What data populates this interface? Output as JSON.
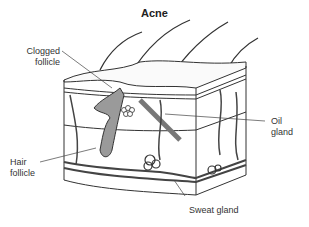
{
  "title": "Acne",
  "labels": {
    "clogged_follicle": [
      "Clogged",
      "follicle"
    ],
    "oil_gland": [
      "Oil",
      "gland"
    ],
    "hair_follicle": [
      "Hair",
      "follicle"
    ],
    "sweat_gland": "Sweat gland"
  },
  "colors": {
    "line": "#333333",
    "follicle_fill": "#9a9a9a",
    "background": "#ffffff"
  }
}
